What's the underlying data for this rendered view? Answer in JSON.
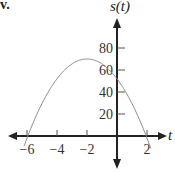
{
  "problem_label": "v.",
  "chart_data": {
    "type": "line",
    "title": "",
    "xlabel": "t",
    "ylabel": "s(t)",
    "x_ticks": [
      -6,
      -4,
      -2,
      2
    ],
    "y_ticks": [
      20,
      40,
      60,
      80
    ],
    "xlim": [
      -7,
      2.8
    ],
    "ylim": [
      -15,
      110
    ],
    "grid": false,
    "legend": null,
    "series": [
      {
        "name": "s(t)",
        "description": "downward-opening parabola",
        "vertex": [
          -2,
          70
        ],
        "y_intercept": 52,
        "x_intercepts": [
          -5.8,
          1.8
        ],
        "x": [
          -6.2,
          -6,
          -5,
          -4,
          -3,
          -2,
          -1,
          0,
          1,
          1.8,
          2.2
        ],
        "values": [
          -10,
          -5,
          22,
          52,
          66,
          70,
          66,
          52,
          32,
          0,
          -10
        ]
      }
    ]
  },
  "colors": {
    "axis": "#222222",
    "curve": "#8a8a8a",
    "text": "#333333"
  }
}
